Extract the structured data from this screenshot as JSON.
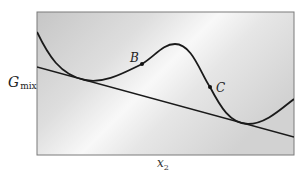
{
  "figure": {
    "y_axis_label_main": "G",
    "y_axis_label_sub": "mix",
    "x_axis_label_main": "x",
    "x_axis_label_sub": "2",
    "points": [
      {
        "label": "B",
        "description": "inflection point on left side of hump"
      },
      {
        "label": "C",
        "description": "inflection point on right side of hump"
      }
    ],
    "elements": [
      "curve",
      "common-tangent-line",
      "frame"
    ],
    "colors": {
      "curve": "#1a1a1a",
      "frame": "#777777",
      "background_gradient_dark": "#c9c9c9",
      "background_gradient_light": "#f7f7f7"
    }
  }
}
